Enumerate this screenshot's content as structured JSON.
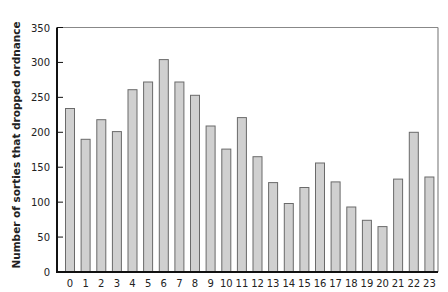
{
  "chart_data": {
    "type": "bar",
    "title": "",
    "xlabel": "",
    "ylabel": "Number of sorties that dropped ordnance",
    "categories": [
      "0",
      "1",
      "2",
      "3",
      "4",
      "5",
      "6",
      "7",
      "8",
      "9",
      "10",
      "11",
      "12",
      "13",
      "14",
      "15",
      "16",
      "17",
      "18",
      "19",
      "20",
      "21",
      "22",
      "23"
    ],
    "values": [
      234,
      190,
      218,
      201,
      261,
      272,
      304,
      272,
      253,
      209,
      176,
      221,
      165,
      128,
      98,
      121,
      156,
      129,
      93,
      74,
      65,
      133,
      200,
      136
    ],
    "ylim": [
      0,
      350
    ],
    "yticks": [
      0,
      50,
      100,
      150,
      200,
      250,
      300,
      350
    ],
    "grid": false,
    "legend": null,
    "colors": {
      "bar_fill": "#d0d0d0",
      "bar_stroke": "#6a6a6a",
      "axis": "#111111",
      "frame": "#888888"
    }
  }
}
